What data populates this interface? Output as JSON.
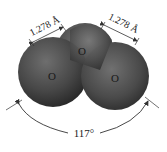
{
  "molecule": {
    "name": "ozone",
    "atoms": [
      {
        "symbol": "O",
        "position": "top-center"
      },
      {
        "symbol": "O",
        "position": "left"
      },
      {
        "symbol": "O",
        "position": "right"
      }
    ],
    "bonds": [
      {
        "label": "1.278 Å",
        "side": "left"
      },
      {
        "label": "1.278 Å",
        "side": "right"
      }
    ],
    "angle": {
      "label": "117°"
    }
  },
  "colors": {
    "atom_dark": "#2e2e2e",
    "atom_light": "#7a7a7a",
    "line": "#333333",
    "background": "#ffffff"
  }
}
